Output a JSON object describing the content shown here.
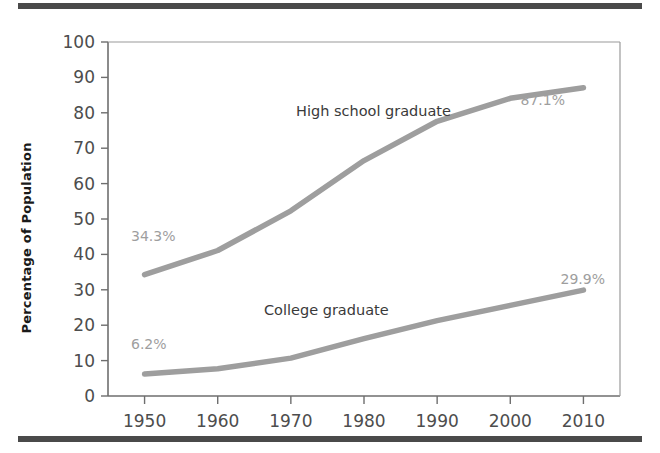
{
  "figure": {
    "top_rule_color": "#4a4a4a",
    "bottom_rule_color": "#4a4a4a",
    "background": "#ffffff"
  },
  "chart_data": {
    "type": "line",
    "title": "",
    "xlabel": "",
    "ylabel": "Percentage of Population",
    "categories": [
      "1950",
      "1960",
      "1970",
      "1980",
      "1990",
      "2000",
      "2010"
    ],
    "x": [
      1950,
      1960,
      1970,
      1980,
      1990,
      2000,
      2010
    ],
    "xlim": [
      1945,
      2015
    ],
    "ylim": [
      0,
      100
    ],
    "ytick_labels": [
      "0",
      "10",
      "20",
      "30",
      "40",
      "50",
      "60",
      "70",
      "80",
      "90",
      "100"
    ],
    "ytick_values": [
      0,
      10,
      20,
      30,
      40,
      50,
      60,
      70,
      80,
      90,
      100
    ],
    "xtick_labels": [
      "1950",
      "1960",
      "1970",
      "1980",
      "1990",
      "2000",
      "2010"
    ],
    "grid": false,
    "legend_position": "inline-annotation",
    "line_color": "#9e9e9e",
    "series": [
      {
        "name": "High school graduate",
        "values": [
          34.3,
          41.1,
          52.3,
          66.5,
          77.6,
          84.1,
          87.1
        ],
        "color": "#9e9e9e",
        "label_text": "High school graduate",
        "start_label": "34.3%",
        "end_label": "87.1%"
      },
      {
        "name": "College graduate",
        "values": [
          6.2,
          7.7,
          10.7,
          16.2,
          21.3,
          25.6,
          29.9
        ],
        "color": "#9e9e9e",
        "label_text": "College graduate",
        "start_label": "6.2%",
        "end_label": "29.9%"
      }
    ],
    "annotations": [
      {
        "text": "High school graduate",
        "kind": "series-label"
      },
      {
        "text": "College graduate",
        "kind": "series-label"
      },
      {
        "text": "34.3%",
        "kind": "value-label"
      },
      {
        "text": "87.1%",
        "kind": "value-label"
      },
      {
        "text": "6.2%",
        "kind": "value-label"
      },
      {
        "text": "29.9%",
        "kind": "value-label"
      }
    ]
  }
}
